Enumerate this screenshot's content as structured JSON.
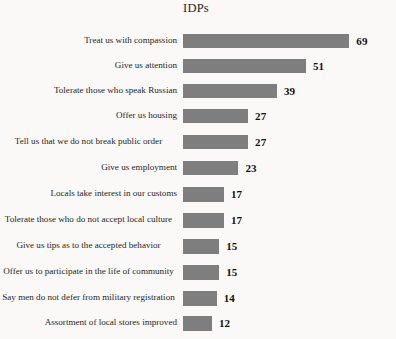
{
  "chart_data": {
    "type": "bar",
    "orientation": "horizontal",
    "title": "IDPs",
    "xlabel": "",
    "ylabel": "",
    "grid": false,
    "legend": null,
    "xlim": [
      0,
      69
    ],
    "value_labels_shown": true,
    "categories": [
      "Treat us with compassion",
      "Give us attention",
      "Tolerate those who speak Russian",
      "Offer us housing",
      "Tell us that we do not break public order",
      "Give us employment",
      "Locals take interest in our customs",
      "Tolerate those who do not accept local culture",
      "Give us tips as to the accepted behavior",
      "Offer us to participate in the life of community",
      "Say men do not defer from military registration",
      "Assortment of local stores improved"
    ],
    "values": [
      69,
      51,
      39,
      27,
      27,
      23,
      17,
      17,
      15,
      15,
      14,
      12
    ],
    "bar_color": "#7e7e7e",
    "background_color": "#faf9f7"
  },
  "rows": [
    {
      "label": "Treat us with compassion",
      "value": 69,
      "value_text": "69",
      "wrapped": false,
      "row_height": 25,
      "bar_height": 14
    },
    {
      "label": "Give us attention",
      "value": 51,
      "value_text": "51",
      "wrapped": false,
      "row_height": 25,
      "bar_height": 14
    },
    {
      "label": "Tolerate those who speak Russian",
      "value": 39,
      "value_text": "39",
      "wrapped": false,
      "row_height": 25,
      "bar_height": 14
    },
    {
      "label": "Offer us housing",
      "value": 27,
      "value_text": "27",
      "wrapped": false,
      "row_height": 25,
      "bar_height": 14
    },
    {
      "label": "Tell us that we do not break public order",
      "value": 27,
      "value_text": "27",
      "wrapped": true,
      "row_height": 27,
      "bar_height": 14
    },
    {
      "label": "Give us employment",
      "value": 23,
      "value_text": "23",
      "wrapped": false,
      "row_height": 26,
      "bar_height": 14
    },
    {
      "label": "Locals take interest in our customs",
      "value": 17,
      "value_text": "17",
      "wrapped": false,
      "row_height": 26,
      "bar_height": 15
    },
    {
      "label": "Tolerate those who do not accept local culture",
      "value": 17,
      "value_text": "17",
      "wrapped": true,
      "row_height": 26,
      "bar_height": 15
    },
    {
      "label": "Give us tips as to the accepted behavior",
      "value": 15,
      "value_text": "15",
      "wrapped": true,
      "row_height": 26,
      "bar_height": 15
    },
    {
      "label": "Offer us to participate in the life of community",
      "value": 15,
      "value_text": "15",
      "wrapped": true,
      "row_height": 26,
      "bar_height": 15
    },
    {
      "label": "Say men do not defer from military registration",
      "value": 14,
      "value_text": "14",
      "wrapped": true,
      "row_height": 26,
      "bar_height": 15
    },
    {
      "label": "Assortment of local stores improved",
      "value": 12,
      "value_text": "12",
      "wrapped": false,
      "row_height": 24,
      "bar_height": 15
    }
  ],
  "scale": {
    "px_per_unit": 2.41,
    "bar_origin_x": 189
  }
}
